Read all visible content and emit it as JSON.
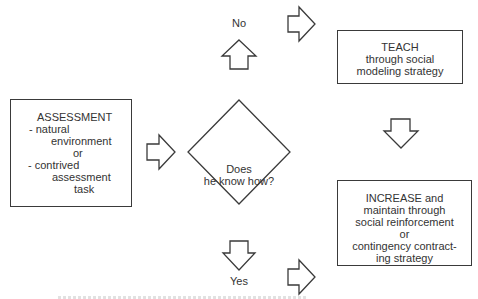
{
  "diagram": {
    "type": "flowchart",
    "assessment_box": {
      "title": "ASSESSMENT",
      "lines": [
        "- natural",
        "environment",
        "or",
        "- contrived",
        "assessment",
        "task"
      ]
    },
    "decision": {
      "line1": "Does",
      "line2": "he know how?"
    },
    "branches": {
      "no_label": "No",
      "yes_label": "Yes"
    },
    "teach_box": {
      "lines": [
        "TEACH",
        "through social",
        "modeling strategy"
      ]
    },
    "increase_box": {
      "lines": [
        "INCREASE and",
        "maintain through",
        "social reinforcement",
        "or",
        "contingency contract-",
        "ing strategy"
      ]
    },
    "icons": {
      "arrow_assessment_to_decision": "block-arrow-right",
      "arrow_no_up": "block-arrow-up",
      "arrow_no_right": "block-arrow-right",
      "arrow_teach_down": "block-arrow-down",
      "arrow_yes_down": "block-arrow-down",
      "arrow_yes_right": "block-arrow-right"
    },
    "colors": {
      "stroke": "#3a3a3a",
      "text": "#333333",
      "background": "#ffffff"
    }
  }
}
